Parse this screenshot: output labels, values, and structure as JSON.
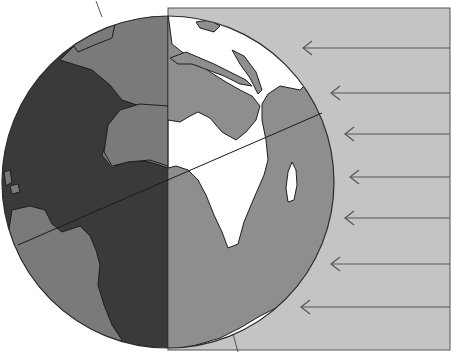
{
  "figure": {
    "caption_fragment": "geographically"
  },
  "colors": {
    "background": "#ffffff",
    "sunlight_band": "#c4c4c4",
    "night_ocean": "#3a3a3a",
    "night_land": "#7a7a7a",
    "day_ocean": "#8e8e8e",
    "day_land": "#ffffff",
    "outline": "#2a2a2a",
    "arrow": "#555555"
  },
  "globe": {
    "cx": 168,
    "cy": 182,
    "r": 166,
    "terminator_x": 168
  },
  "sunlight_band": {
    "x": 168,
    "y": 8,
    "right": 450,
    "bottom": 350
  },
  "tilt_line": {
    "x1": 18,
    "y1": 245,
    "x2": 322,
    "y2": 113
  },
  "axis_segments": [
    {
      "x1": 96,
      "y1": 1,
      "x2": 102,
      "y2": 17
    },
    {
      "x1": 233,
      "y1": 334,
      "x2": 238,
      "y2": 352
    }
  ],
  "sun_rays": [
    {
      "y": 48,
      "head_x": 303
    },
    {
      "y": 93,
      "head_x": 331
    },
    {
      "y": 134,
      "head_x": 345
    },
    {
      "y": 177,
      "head_x": 350
    },
    {
      "y": 218,
      "head_x": 345
    },
    {
      "y": 264,
      "head_x": 331
    },
    {
      "y": 307,
      "head_x": 301
    }
  ],
  "labels": {
    "night_side": "Night side",
    "day_side": "Day side",
    "rays": "Sun's rays"
  }
}
